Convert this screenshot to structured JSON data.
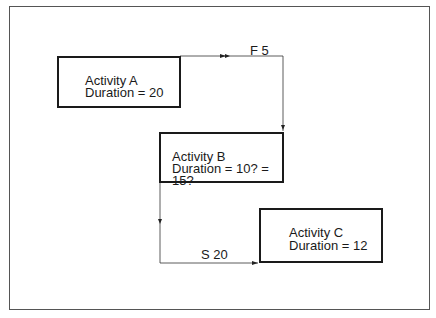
{
  "diagram": {
    "type": "precedence-network",
    "activities": [
      {
        "id": "A",
        "name": "Activity A",
        "duration": "Duration = 20"
      },
      {
        "id": "B",
        "name": "Activity B",
        "duration": "Duration = 10? = 15?"
      },
      {
        "id": "C",
        "name": "Activity C",
        "duration": "Duration = 12"
      }
    ],
    "links": [
      {
        "from": "A",
        "to": "B",
        "label": "F 5",
        "type": "finish-to-finish"
      },
      {
        "from": "B",
        "to": "C",
        "label": "S 20",
        "type": "start-to-start"
      }
    ]
  }
}
